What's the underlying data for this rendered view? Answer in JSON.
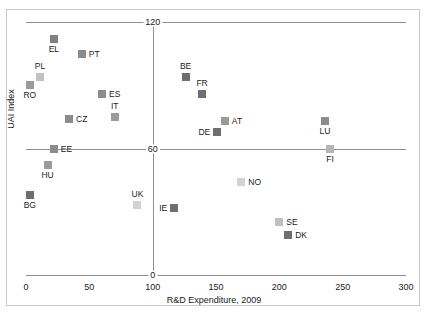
{
  "chart_data": {
    "type": "scatter",
    "title": "",
    "xlabel": "R&D Expenditure, 2009",
    "ylabel": "UAI Index",
    "xlim": [
      0,
      300
    ],
    "ylim": [
      0,
      120
    ],
    "xticks": [
      0,
      50,
      100,
      150,
      200,
      250,
      300
    ],
    "xtick_labels": [
      "0",
      "50",
      "100",
      "150",
      "200",
      "250",
      "300"
    ],
    "yticks": [
      0,
      60,
      120
    ],
    "ytick_labels": [
      "0",
      "60",
      "120"
    ],
    "grid": false,
    "reference_lines": {
      "vertical_x": 100,
      "horizontal_y": 60
    },
    "legend": null,
    "points": [
      {
        "label": "EL",
        "x": 22,
        "y": 112,
        "color": "#808080",
        "label_pos": "below"
      },
      {
        "label": "PT",
        "x": 44,
        "y": 105,
        "color": "#8c8c8c",
        "label_pos": "right"
      },
      {
        "label": "PL",
        "x": 11,
        "y": 94,
        "color": "#c0c0c0",
        "label_pos": "above"
      },
      {
        "label": "RO",
        "x": 3,
        "y": 90,
        "color": "#9a9a9a",
        "label_pos": "below"
      },
      {
        "label": "ES",
        "x": 60,
        "y": 86,
        "color": "#8c8c8c",
        "label_pos": "right"
      },
      {
        "label": "IT",
        "x": 70,
        "y": 75,
        "color": "#9a9a9a",
        "label_pos": "above"
      },
      {
        "label": "CZ",
        "x": 34,
        "y": 74,
        "color": "#8c8c8c",
        "label_pos": "right"
      },
      {
        "label": "BE",
        "x": 126,
        "y": 94,
        "color": "#6e6e6e",
        "label_pos": "above"
      },
      {
        "label": "FR",
        "x": 139,
        "y": 86,
        "color": "#6e6e6e",
        "label_pos": "above"
      },
      {
        "label": "AT",
        "x": 157,
        "y": 73,
        "color": "#9a9a9a",
        "label_pos": "right"
      },
      {
        "label": "DE",
        "x": 151,
        "y": 68,
        "color": "#6e6e6e",
        "label_pos": "left"
      },
      {
        "label": "LU",
        "x": 236,
        "y": 73,
        "color": "#8c8c8c",
        "label_pos": "below"
      },
      {
        "label": "FI",
        "x": 240,
        "y": 60,
        "color": "#b5b5b5",
        "label_pos": "below"
      },
      {
        "label": "EE",
        "x": 22,
        "y": 60,
        "color": "#8c8c8c",
        "label_pos": "right"
      },
      {
        "label": "HU",
        "x": 17,
        "y": 52,
        "color": "#9a9a9a",
        "label_pos": "below"
      },
      {
        "label": "NO",
        "x": 170,
        "y": 44,
        "color": "#d2d2d2",
        "label_pos": "right"
      },
      {
        "label": "BG",
        "x": 3,
        "y": 38,
        "color": "#6e6e6e",
        "label_pos": "below"
      },
      {
        "label": "UK",
        "x": 88,
        "y": 33,
        "color": "#d2d2d2",
        "label_pos": "above"
      },
      {
        "label": "IE",
        "x": 117,
        "y": 32,
        "color": "#6e6e6e",
        "label_pos": "left"
      },
      {
        "label": "SE",
        "x": 200,
        "y": 25,
        "color": "#c0c0c0",
        "label_pos": "right"
      },
      {
        "label": "DK",
        "x": 207,
        "y": 19,
        "color": "#6e6e6e",
        "label_pos": "right"
      }
    ]
  },
  "axis_color": "#8f8f8f",
  "frame_color": "#c9c9c9"
}
